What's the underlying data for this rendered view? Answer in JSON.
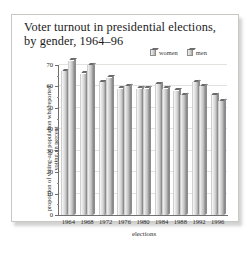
{
  "figure": {
    "title": "Voter turnout in presidential elections, by gender, 1964–96"
  },
  "legend": {
    "position": "top-right",
    "items": [
      {
        "label": "women",
        "icon": "bar-swatch-icon"
      },
      {
        "label": "men",
        "icon": "bar-swatch-icon"
      }
    ]
  },
  "chart_data": {
    "type": "bar",
    "title": "Voter turnout in presidential elections, by gender, 1964–96",
    "xlabel": "elections",
    "ylabel": "proportion of voting-age population who reported voting, in percent",
    "categories": [
      "1964",
      "1968",
      "1972",
      "1976",
      "1980",
      "1984",
      "1988",
      "1992",
      "1996"
    ],
    "series": [
      {
        "name": "women",
        "values": [
          67,
          66,
          62,
          59,
          59,
          61,
          58,
          62,
          56
        ]
      },
      {
        "name": "men",
        "values": [
          72,
          70,
          64,
          60,
          59,
          59,
          56,
          60,
          53
        ]
      }
    ],
    "ylim": [
      0,
      70
    ],
    "yticks": [
      0,
      10,
      20,
      30,
      40,
      50,
      60,
      70
    ],
    "ytick_labels": [
      "0",
      "10",
      "20",
      "30",
      "40",
      "50",
      "60",
      "70"
    ],
    "grid": true,
    "legend_position": "top-right",
    "bar_style": "3d-shaded-gray"
  }
}
